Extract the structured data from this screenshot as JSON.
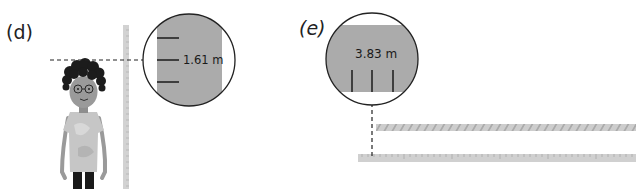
{
  "panels": [
    {
      "id": "d",
      "label": "(d)",
      "measurement": "1.61 m",
      "subject": "person",
      "instrument": "vertical-ruler"
    },
    {
      "id": "e",
      "label": "(e)",
      "measurement": "3.83 m",
      "subject": "hatched-bar",
      "instrument": "horizontal-ruler"
    }
  ],
  "colors": {
    "ruler": "#cfcfcf",
    "magnifier_fill": "#a9a9a9",
    "outline": "#222222",
    "hair": "#1c1c1c",
    "skin": "#9a9a9a",
    "shirt": "#c4c4c4",
    "pants": "#1a1a1a"
  }
}
